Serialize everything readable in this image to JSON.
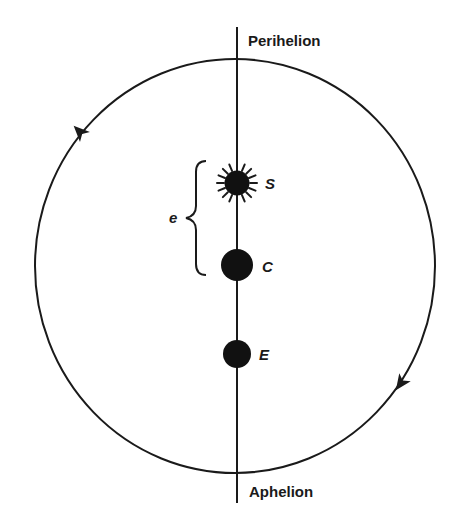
{
  "diagram": {
    "labels": {
      "perihelion": "Perihelion",
      "aphelion": "Aphelion",
      "sun": "S",
      "center": "C",
      "earth": "E",
      "eccentricity": "e"
    },
    "colors": {
      "ink": "#1a1a1a",
      "background": "#ffffff"
    },
    "orbit": {
      "cx": 235,
      "cy": 266,
      "rx": 200,
      "ry": 207,
      "direction": "clockwise"
    },
    "axis": {
      "x": 237,
      "y_top": 27,
      "y_bottom": 503
    },
    "bodies": [
      {
        "name": "sun",
        "cx": 237,
        "cy": 183,
        "r": 12,
        "rays": 16
      },
      {
        "name": "center",
        "cx": 237,
        "cy": 265,
        "r": 16
      },
      {
        "name": "earth",
        "cx": 237,
        "cy": 354,
        "r": 14
      }
    ],
    "arrows": [
      {
        "name": "arrow-upper-left",
        "x": 80,
        "y": 132,
        "direction": "up-right"
      },
      {
        "name": "arrow-lower-right",
        "x": 401,
        "y": 383,
        "direction": "down-left"
      }
    ]
  }
}
